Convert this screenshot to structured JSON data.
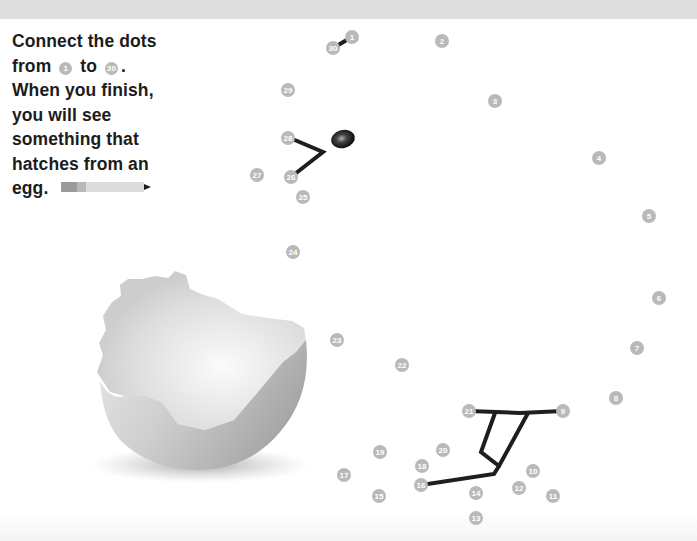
{
  "instructions": {
    "line1": "Connect the dots",
    "line2_prefix": "from",
    "start_dot": "1",
    "line2_mid": "to",
    "end_dot": "30",
    "line2_suffix": ".",
    "line3": "When you finish,",
    "line4": "you will see",
    "line5": "something that",
    "line6": "hatches from an",
    "line7": "egg."
  },
  "icons": {
    "pencil": "pencil-icon",
    "egg": "cracked-eggshell-illustration",
    "eye": "chick-eye"
  },
  "colors": {
    "dot_fill": "#b9b9b9",
    "line": "#1e1e1e",
    "text": "#1c1c1c",
    "top_band": "#dedede"
  },
  "dots": [
    {
      "n": "1",
      "x": 352,
      "y": 37
    },
    {
      "n": "2",
      "x": 442,
      "y": 41
    },
    {
      "n": "3",
      "x": 495,
      "y": 101
    },
    {
      "n": "4",
      "x": 599,
      "y": 158
    },
    {
      "n": "5",
      "x": 649,
      "y": 216
    },
    {
      "n": "6",
      "x": 659,
      "y": 298
    },
    {
      "n": "7",
      "x": 637,
      "y": 348
    },
    {
      "n": "8",
      "x": 616,
      "y": 398
    },
    {
      "n": "9",
      "x": 563,
      "y": 411
    },
    {
      "n": "10",
      "x": 533,
      "y": 471
    },
    {
      "n": "11",
      "x": 553,
      "y": 496
    },
    {
      "n": "12",
      "x": 519,
      "y": 488
    },
    {
      "n": "13",
      "x": 476,
      "y": 518
    },
    {
      "n": "14",
      "x": 476,
      "y": 493
    },
    {
      "n": "15",
      "x": 379,
      "y": 496
    },
    {
      "n": "16",
      "x": 421,
      "y": 485
    },
    {
      "n": "17",
      "x": 344,
      "y": 475
    },
    {
      "n": "18",
      "x": 422,
      "y": 466
    },
    {
      "n": "19",
      "x": 380,
      "y": 452
    },
    {
      "n": "20",
      "x": 443,
      "y": 450
    },
    {
      "n": "21",
      "x": 469,
      "y": 411
    },
    {
      "n": "22",
      "x": 402,
      "y": 365
    },
    {
      "n": "23",
      "x": 337,
      "y": 340
    },
    {
      "n": "24",
      "x": 293,
      "y": 252
    },
    {
      "n": "25",
      "x": 303,
      "y": 197
    },
    {
      "n": "26",
      "x": 291,
      "y": 177
    },
    {
      "n": "27",
      "x": 257,
      "y": 175
    },
    {
      "n": "28",
      "x": 288,
      "y": 138
    },
    {
      "n": "29",
      "x": 288,
      "y": 90
    },
    {
      "n": "30",
      "x": 333,
      "y": 48
    }
  ],
  "drawn_lines": [
    {
      "name": "beak",
      "points": "290,138 323,152 291,177"
    },
    {
      "name": "dot30-to-dot1",
      "points": "335,47 350,38"
    },
    {
      "name": "foot-top",
      "points": "469,411 520,413 563,411"
    },
    {
      "name": "leg-front",
      "points": "495,413 481,452 499,466"
    },
    {
      "name": "leg-back",
      "points": "528,413 499,466 494,474 421,485"
    }
  ]
}
